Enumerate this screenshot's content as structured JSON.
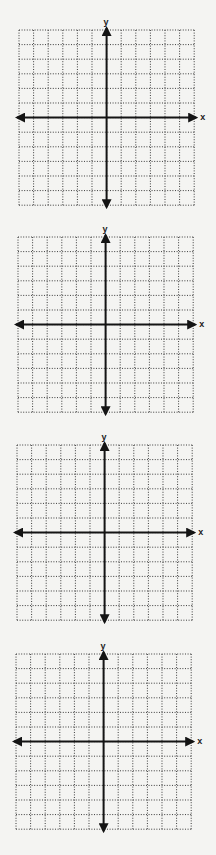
{
  "colors": {
    "background": "#f4f4f2",
    "grid_dots": "#3a3a3a",
    "axes": "#141414"
  },
  "grid": {
    "cells_x": 12,
    "cells_y": 12,
    "cell_size_px": 14.6
  },
  "planes": [
    {
      "id": 1,
      "left": 19,
      "top": 30,
      "x_label": "x",
      "y_label": "y"
    },
    {
      "id": 2,
      "left": 18,
      "top": 237,
      "x_label": "x",
      "y_label": "y"
    },
    {
      "id": 3,
      "left": 17,
      "top": 445,
      "x_label": "x",
      "y_label": "y"
    },
    {
      "id": 4,
      "left": 16,
      "top": 654,
      "x_label": "x",
      "y_label": "y"
    }
  ]
}
